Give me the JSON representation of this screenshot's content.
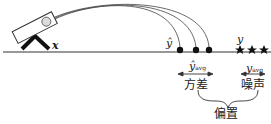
{
  "diagram": {
    "labels": {
      "x": "x",
      "y_hat": "ŷ",
      "y": "y",
      "y_hat_avg_main": "ŷ",
      "y_hat_avg_sub": "avg",
      "y_avg_main": "y",
      "y_avg_sub": "avg",
      "variance": "方差",
      "noise": "噪声",
      "bias": "偏置"
    },
    "colors": {
      "ink": "#111111",
      "line": "#333333"
    }
  }
}
